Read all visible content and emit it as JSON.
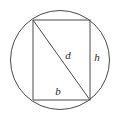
{
  "figure": {
    "background_color": "#ffffff",
    "stroke_color": "#4a4a4a",
    "label_color": "#2b2b2b",
    "circle": {
      "name": "circumscribed-circle",
      "center_x": 60,
      "center_y": 60,
      "radius": 49.5
    },
    "rectangle": {
      "name": "inscribed-rectangle",
      "left": 33,
      "top": 20,
      "right": 90,
      "bottom": 100,
      "width": 57,
      "height": 80
    },
    "diagonal": {
      "name": "rectangle-diagonal",
      "x1": 33,
      "y1": 20,
      "x2": 90,
      "y2": 100
    },
    "labels": [
      {
        "id": "diagonal",
        "text": "d",
        "x": 68,
        "y": 59,
        "describes": "diagonal of rectangle / diameter of circle"
      },
      {
        "id": "height",
        "text": "h",
        "x": 97,
        "y": 61,
        "describes": "height of rectangle (right side)"
      },
      {
        "id": "base",
        "text": "b",
        "x": 58,
        "y": 95,
        "describes": "base of rectangle (bottom side)"
      }
    ]
  }
}
